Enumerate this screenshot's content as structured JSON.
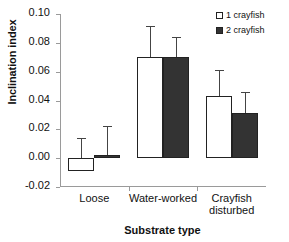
{
  "chart_data": {
    "type": "bar",
    "title": "",
    "xlabel": "Substrate type",
    "ylabel": "Inclination index",
    "categories": [
      "Loose",
      "Water-worked",
      "Crayfish\ndisturbed"
    ],
    "ylim": [
      -0.02,
      0.1
    ],
    "ytick_labels": [
      "0.10",
      "0.08",
      "0.06",
      "0.04",
      "0.02",
      "0.00",
      "-0.02"
    ],
    "ytick_values": [
      0.1,
      0.08,
      0.06,
      0.04,
      0.02,
      0.0,
      -0.02
    ],
    "grid": false,
    "legend_position": "top-right",
    "series": [
      {
        "name": "1 crayfish",
        "color": "#ffffff",
        "values": [
          -0.009,
          0.07,
          0.043
        ],
        "error_upper": [
          0.014,
          0.092,
          0.061
        ]
      },
      {
        "name": "2 crayfish",
        "color": "#333333",
        "values": [
          0.002,
          0.07,
          0.031
        ],
        "error_upper": [
          0.022,
          0.084,
          0.046
        ]
      }
    ]
  },
  "legend": {
    "items": [
      {
        "label": "1 crayfish",
        "swatch": "open-square-icon"
      },
      {
        "label": "2 crayfish",
        "swatch": "filled-square-icon"
      }
    ]
  },
  "axes": {
    "y_title": "Inclination index",
    "x_title": "Substrate type",
    "y_ticks": [
      "0.10",
      "0.08",
      "0.06",
      "0.04",
      "0.02",
      "0.00",
      "-0.02"
    ],
    "x_ticks": [
      "Loose",
      "Water-worked",
      "Crayfish\ndisturbed"
    ]
  }
}
